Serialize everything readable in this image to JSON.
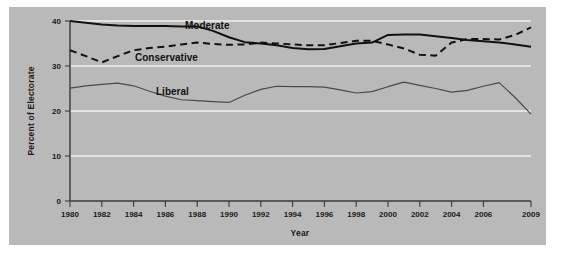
{
  "figure": {
    "background_color": "#b9b9b9",
    "page_color": "#ffffff",
    "gridline_color": "#f2f2f2",
    "axis_color": "#3a3a3a"
  },
  "labels": {
    "ylabel": "Percent of Electorate",
    "xlabel": "Year",
    "moderate": "Moderate",
    "conservative": "Conservative",
    "liberal": "Liberal"
  },
  "chart_data": {
    "type": "line",
    "title": "",
    "subtitle": "",
    "xlabel": "Year",
    "ylabel": "Percent of Electorate",
    "xlim": [
      1980,
      2009
    ],
    "ylim": [
      0,
      40
    ],
    "yticks": [
      0,
      10,
      20,
      30,
      40
    ],
    "ytick_labels": [
      "0",
      "10",
      "20",
      "30",
      "40"
    ],
    "xticks": [
      1980,
      1982,
      1984,
      1986,
      1988,
      1990,
      1992,
      1994,
      1996,
      1998,
      2000,
      2002,
      2004,
      2006,
      2009
    ],
    "xtick_labels": [
      "1980",
      "1982",
      "1984",
      "1986",
      "1988",
      "1990",
      "1992",
      "1994",
      "1996",
      "1998",
      "2000",
      "2002",
      "2004",
      "2006",
      "2009"
    ],
    "grid": "horizontal",
    "legend_position": "inline-annotations",
    "x": [
      1980,
      1981,
      1982,
      1983,
      1984,
      1985,
      1986,
      1987,
      1988,
      1989,
      1990,
      1991,
      1992,
      1993,
      1994,
      1995,
      1996,
      1997,
      1998,
      1999,
      2000,
      2001,
      2002,
      2003,
      2004,
      2005,
      2006,
      2007,
      2008,
      2009
    ],
    "series": [
      {
        "name": "Moderate",
        "style": "solid",
        "color": "#111111",
        "width": 2.0,
        "values": [
          40.0,
          39.6,
          39.2,
          39.0,
          38.9,
          38.9,
          38.9,
          38.8,
          38.8,
          37.8,
          36.4,
          35.3,
          35.0,
          34.6,
          34.0,
          33.7,
          33.8,
          34.4,
          35.0,
          35.2,
          36.9,
          37.0,
          37.0,
          36.6,
          36.2,
          35.8,
          35.5,
          35.2,
          34.8,
          34.3
        ]
      },
      {
        "name": "Conservative",
        "style": "dashed",
        "color": "#111111",
        "width": 2.0,
        "values": [
          33.5,
          32.2,
          30.8,
          32.2,
          33.5,
          34.0,
          34.3,
          34.8,
          35.2,
          34.9,
          34.7,
          34.8,
          35.2,
          35.0,
          34.8,
          34.6,
          34.6,
          35.1,
          35.6,
          35.6,
          34.8,
          33.9,
          32.5,
          32.3,
          35.2,
          36.0,
          36.0,
          35.9,
          36.9,
          38.6
        ]
      },
      {
        "name": "Liberal",
        "style": "solid",
        "color": "#4a4a4a",
        "width": 1.2,
        "values": [
          25.1,
          25.6,
          25.9,
          26.2,
          25.6,
          24.4,
          23.3,
          22.5,
          22.3,
          22.1,
          21.9,
          23.5,
          24.8,
          25.5,
          25.4,
          25.4,
          25.3,
          24.7,
          24.0,
          24.3,
          25.4,
          26.4,
          25.7,
          25.0,
          24.2,
          24.6,
          25.5,
          26.3,
          23.0,
          19.3
        ]
      }
    ]
  }
}
